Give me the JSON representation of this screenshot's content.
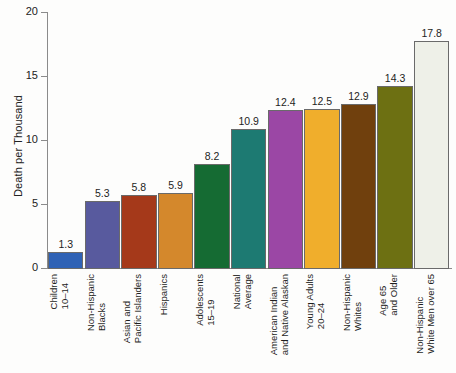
{
  "chart_data": {
    "type": "bar",
    "title": "",
    "xlabel": "",
    "ylabel": "Death per Thousand",
    "ylim": [
      0,
      20
    ],
    "yticks": [
      0,
      5,
      10,
      15,
      20
    ],
    "ytick_labels": [
      "0",
      "5",
      "10",
      "15",
      "20"
    ],
    "grid": false,
    "legend": "none",
    "categories": [
      "Children 10–14",
      "Non-Hispanic Blacks",
      "Asian and Pacific Islanders",
      "Hispanics",
      "Adolescents 15–19",
      "National Average",
      "American Indian and Native Alaskan",
      "Young Adults 20–24",
      "Non-Hispanic Whites",
      "Age 65 and Older",
      "Non-Hispanic White Men over 65"
    ],
    "category_lines": [
      [
        "Children",
        "10–14"
      ],
      [
        "Non-Hispanic",
        "Blacks"
      ],
      [
        "Asian and",
        "Pacific Islanders"
      ],
      [
        "Hispanics",
        ""
      ],
      [
        "Adolescents",
        "15–19"
      ],
      [
        "National",
        "Average"
      ],
      [
        "American Indian",
        "and Native Alaskan"
      ],
      [
        "Young Adults",
        "20–24"
      ],
      [
        "Non-Hispanic",
        "Whites"
      ],
      [
        "Age 65",
        "and Older"
      ],
      [
        "Non-Hispanic",
        "White Men over 65"
      ]
    ],
    "values": [
      1.3,
      5.3,
      5.8,
      5.9,
      8.2,
      10.9,
      12.4,
      12.5,
      12.9,
      14.3,
      17.8
    ],
    "value_labels": [
      "1.3",
      "5.3",
      "5.8",
      "5.9",
      "8.2",
      "10.9",
      "12.4",
      "12.5",
      "12.9",
      "14.3",
      "17.8"
    ],
    "colors": [
      "#2f62b5",
      "#585a9e",
      "#a5391a",
      "#d4882c",
      "#156b33",
      "#1d7a72",
      "#9b47a5",
      "#f0ae2c",
      "#70400d",
      "#6d7012",
      "#eef0e8"
    ]
  }
}
